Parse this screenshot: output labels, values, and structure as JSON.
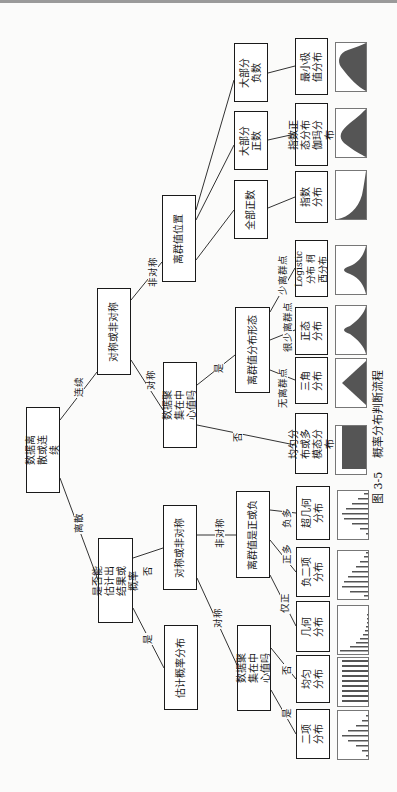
{
  "figure": {
    "caption_number": "图 3-5",
    "caption_title": "概率分布判断流程"
  },
  "nodes": {
    "root": "数据离散或连续",
    "continuous_symmetry": "对称或非对称",
    "outlier_position": "离群值位置",
    "continuous_center": "数据聚集在中心值吗",
    "outlier_shape": "离群值分布形态",
    "mostly_negative": "大部分负数",
    "mostly_positive": "大部分正数",
    "all_positive": "全部正数",
    "can_estimate": "是否能估计出结果或概率",
    "estimate_prob": "估计概率分布",
    "discrete_symmetry": "对称或非对称",
    "discrete_center": "数据聚集在中心值吗",
    "outlier_sign": "离群值是正或负"
  },
  "edge_labels": {
    "continuous": "连续",
    "discrete": "离散",
    "asymmetric": "非对称",
    "symmetric": "对称",
    "yes": "是",
    "no": "否",
    "no_outliers": "无离群点",
    "few_outliers": "很少离群点",
    "less_outliers": "少离群点",
    "d_symmetric": "对称",
    "d_asymmetric": "非对称",
    "d_no": "否",
    "d_yes": "是",
    "only_positive": "仅正",
    "more_positive": "正多",
    "more_negative": "负多",
    "c_no": "否",
    "c_yes": "是"
  },
  "leaves_continuous": [
    {
      "label": "最小极值分布",
      "shape": "min-extreme"
    },
    {
      "label": "指数正态分布 伽玛分布",
      "shape": "lognormal"
    },
    {
      "label": "指数分布",
      "shape": "exponential"
    },
    {
      "label": "Logistic分布 柯西分布",
      "shape": "logistic"
    },
    {
      "label": "正态分布",
      "shape": "normal"
    },
    {
      "label": "三角分布",
      "shape": "triangle"
    },
    {
      "label": "均匀分布或多模态分布",
      "shape": "uniform"
    }
  ],
  "leaves_discrete": [
    {
      "label": "超几何分布",
      "shape": "hypergeometric"
    },
    {
      "label": "负二项分布",
      "shape": "negative-binomial"
    },
    {
      "label": "几何分布",
      "shape": "geometric"
    },
    {
      "label": "均匀分布",
      "shape": "discrete-uniform"
    },
    {
      "label": "二项分布",
      "shape": "binomial"
    }
  ],
  "colors": {
    "fill": "#555555",
    "line": "#1a1a1a"
  }
}
